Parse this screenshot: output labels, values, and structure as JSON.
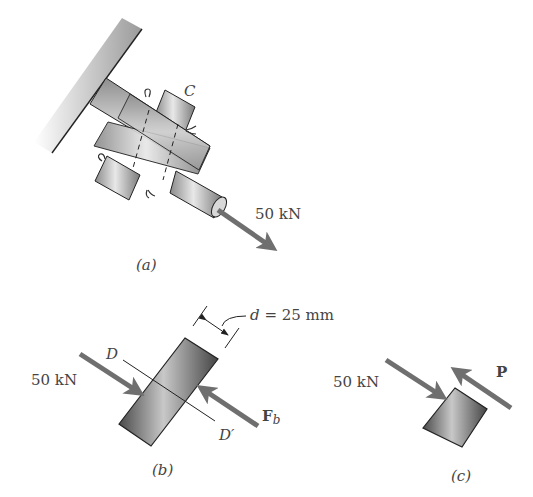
{
  "figure_a": {
    "label": "(a)",
    "connection_label": "C",
    "load_label": "50 kN"
  },
  "figure_b": {
    "label": "(b)",
    "load_left_label": "50 kN",
    "section_top": "D",
    "section_bottom": "D′",
    "bearing_force": "F",
    "bearing_force_sub": "b",
    "diameter_label": "d = 25 mm"
  },
  "figure_c": {
    "label": "(c)",
    "load_left_label": "50 kN",
    "force_label": "P"
  },
  "colors": {
    "arrow": "#6f6f6f",
    "outline": "#222222",
    "text": "#444444",
    "metal_light": "#e6e6e6",
    "metal_dark": "#555555"
  }
}
